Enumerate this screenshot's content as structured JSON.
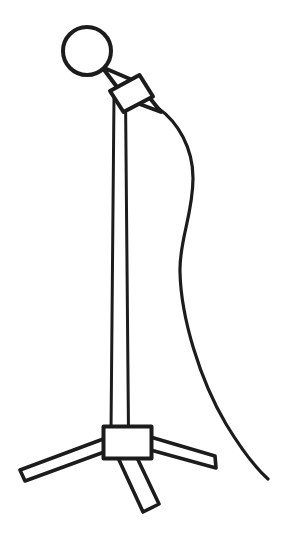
{
  "document": {
    "title": "Microphone on Tripod Stand",
    "type": "black-and-white line drawing",
    "width": 289,
    "height": 539
  },
  "canvas": {
    "background_color": "#ffffff",
    "ink_color": "#1c1c1c"
  },
  "objects": {
    "mic_head": {
      "label": "Microphone grille head",
      "shape": "circle",
      "cx": 87,
      "cy": 51,
      "r": 24,
      "stroke_width": 4
    },
    "mic_body": {
      "label": "Microphone body",
      "shape": "tilted rectangle",
      "points": "103,69 137,84 160,113 125,99",
      "stroke_width": 4
    },
    "mic_collar": {
      "label": "Microphone clip collar",
      "shape": "tilted rectangle",
      "points": "110,90 139,76 153,97 124,111",
      "stroke_width": 4
    },
    "stand_pole": {
      "label": "Vertical stand pole",
      "shape": "tapered column",
      "points": "114,98 125,98 128,430 111,430",
      "top_y": 98,
      "bottom_y": 432,
      "stroke_width": 3
    },
    "base_hub": {
      "label": "Tripod base hub block",
      "shape": "rectangle",
      "x": 103,
      "y": 426,
      "width": 48,
      "height": 32,
      "stroke_width": 4
    },
    "leg_left": {
      "label": "Left tripod leg",
      "shape": "tapered bar",
      "points": "104,440 104,450 24,480 20,470",
      "stroke_width": 4
    },
    "leg_right": {
      "label": "Right tripod leg",
      "shape": "tapered bar",
      "points": "150,437 150,447 216,467 214,456",
      "stroke_width": 4
    },
    "leg_center": {
      "label": "Center front tripod leg",
      "shape": "tapered bar",
      "points": "114,450 130,447 158,505 143,511",
      "stroke_width": 4
    },
    "cable": {
      "label": "Microphone cable",
      "shape": "s-curve",
      "path": "M 158,108 C 178,122 193,148 193,178 C 193,215 179,240 180,272 C 181,318 200,380 226,424 C 243,452 258,470 268,479",
      "stroke_width": 3,
      "start_point": [
        158,
        108
      ],
      "end_point": [
        268,
        479
      ]
    }
  }
}
